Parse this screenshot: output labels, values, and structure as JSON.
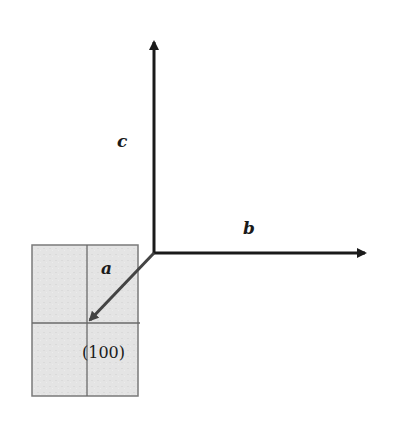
{
  "diagram": {
    "type": "crystal-axes-plane",
    "axes": {
      "a": {
        "label": "a",
        "direction": "toward viewer (down-left)"
      },
      "b": {
        "label": "b",
        "direction": "right"
      },
      "c": {
        "label": "c",
        "direction": "up"
      }
    },
    "plane": {
      "label": "(100)",
      "fill": "#e2e2e2",
      "border": "#7a7a7a"
    },
    "colors": {
      "axis": "#1a1a1a",
      "a_arrow": "#444444"
    }
  },
  "caption": {
    "text": ""
  }
}
